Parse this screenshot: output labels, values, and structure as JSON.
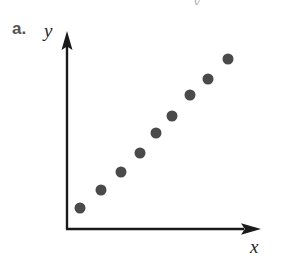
{
  "figure": {
    "part_label": "a.",
    "top_artifact_text": "y",
    "background_color": "#ffffff"
  },
  "axes": {
    "x_label": "x",
    "y_label": "y",
    "axis_color": "#1a1a1a",
    "origin_px": {
      "x": 67,
      "y": 229
    },
    "x_axis_end_px": {
      "x": 258,
      "y": 229
    },
    "y_axis_end_px": {
      "x": 67,
      "y": 42
    },
    "has_x_arrowhead": true,
    "has_y_arrowhead": true,
    "has_tick_marks": false,
    "has_tick_labels": false,
    "has_gridlines": false
  },
  "chart_data": {
    "type": "scatter",
    "title": "",
    "subtitle": "",
    "xlabel": "x",
    "ylabel": "y",
    "xlim": [
      0,
      10
    ],
    "ylim": [
      0,
      10
    ],
    "grid": false,
    "legend": false,
    "legend_position": "none",
    "annotations": [
      "a."
    ],
    "marker": {
      "shape": "circle",
      "color": "#4a4a4a",
      "diameter_px": 11
    },
    "series": [
      {
        "name": "points",
        "x": [
          1.0,
          2.0,
          3.0,
          4.0,
          5.0,
          6.0,
          7.0,
          8.0,
          9.0
        ],
        "y": [
          1.1,
          2.1,
          3.1,
          4.1,
          5.1,
          6.0,
          7.1,
          8.0,
          9.1
        ]
      }
    ],
    "points_px": [
      {
        "cx": 80,
        "cy": 208
      },
      {
        "cx": 101,
        "cy": 190
      },
      {
        "cx": 121,
        "cy": 172
      },
      {
        "cx": 140,
        "cy": 153
      },
      {
        "cx": 156,
        "cy": 133
      },
      {
        "cx": 172,
        "cy": 116
      },
      {
        "cx": 190,
        "cy": 95
      },
      {
        "cx": 208,
        "cy": 79
      },
      {
        "cx": 228,
        "cy": 59
      }
    ]
  }
}
